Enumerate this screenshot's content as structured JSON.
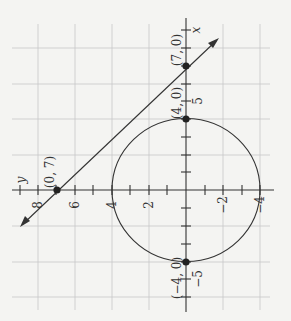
{
  "figure": {
    "axes": {
      "x_label": "x",
      "y_label": "y",
      "x_ticks": [
        {
          "value": 5,
          "label": "5"
        },
        {
          "value": -5,
          "label": "−5"
        }
      ],
      "y_ticks": [
        {
          "value": 8,
          "label": "8"
        },
        {
          "value": 6,
          "label": "6"
        },
        {
          "value": 4,
          "label": "4"
        },
        {
          "value": 2,
          "label": "2"
        },
        {
          "value": -2,
          "label": "−2"
        },
        {
          "value": -4,
          "label": "−4"
        }
      ]
    },
    "points": [
      {
        "label": "(7, 0)",
        "x": 7,
        "y": 0
      },
      {
        "label": "(4, 0)",
        "x": 4,
        "y": 0
      },
      {
        "label": "(−4, 0)",
        "x": -4,
        "y": 0
      },
      {
        "label": "(0, 7)",
        "x": 0,
        "y": 7
      }
    ],
    "circle": {
      "center": [
        0,
        0
      ],
      "radius": 4
    },
    "line": {
      "through": [
        [
          7,
          0
        ],
        [
          0,
          7
        ]
      ]
    },
    "colors": {
      "background": "#f4f4f2",
      "grid": "#c8c8c8",
      "ink": "#333333"
    }
  }
}
